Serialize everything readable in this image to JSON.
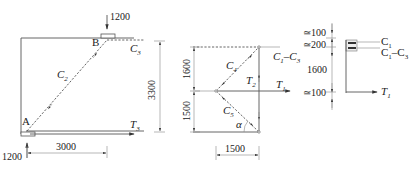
{
  "figure_left": {
    "load_top": "1200",
    "load_bottom": "1200",
    "node_a": "A",
    "node_b": "B",
    "member_c2": "C",
    "member_c2_sub": "2",
    "member_c3": "C",
    "member_c3_sub": "3",
    "member_t3": "T",
    "member_t3_sub": "3",
    "dim_height": "3300",
    "dim_width": "3000"
  },
  "figure_middle": {
    "dim_upper": "1600",
    "dim_lower": "1500",
    "dim_width": "1500",
    "member_c4": "C",
    "member_c4_sub": "4",
    "member_c5": "C",
    "member_c5_sub": "5",
    "member_t2": "T",
    "member_t2_sub": "2",
    "member_t1": "T",
    "member_t1_sub": "1",
    "member_c1c3": "C",
    "member_c1c3_sub1": "1",
    "member_c1c3_dash": "–C",
    "member_c1c3_sub2": "3",
    "angle": "α"
  },
  "figure_right": {
    "dim_1": "≃100",
    "dim_2": "≃200",
    "dim_3": "1600",
    "dim_4": "≃100",
    "label_c1": "C",
    "label_c1_sub": "1",
    "label_c1c3": "C",
    "label_c1c3_sub1": "1",
    "label_c1c3_dash": "–C",
    "label_c1c3_sub2": "3",
    "label_t1": "T",
    "label_t1_sub": "1"
  }
}
